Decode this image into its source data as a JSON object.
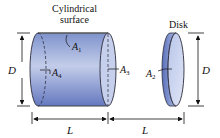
{
  "diagram": {
    "title_labels": {
      "cylinder_label_line1": "Cylindrical",
      "cylinder_label_line2": "surface",
      "disk_label": "Disk"
    },
    "area_labels": {
      "a1": {
        "base": "A",
        "sub": "1"
      },
      "a2": {
        "base": "A",
        "sub": "2"
      },
      "a3": {
        "base": "A",
        "sub": "3"
      },
      "a4": {
        "base": "A",
        "sub": "4"
      }
    },
    "dimension_labels": {
      "cylinder_diameter": "D",
      "disk_diameter": "D",
      "cylinder_length": "L",
      "gap_length": "L"
    },
    "colors": {
      "body_dark": "#5a72b8",
      "body_light": "#c9d4ee",
      "outline": "#2a2a3a"
    }
  }
}
